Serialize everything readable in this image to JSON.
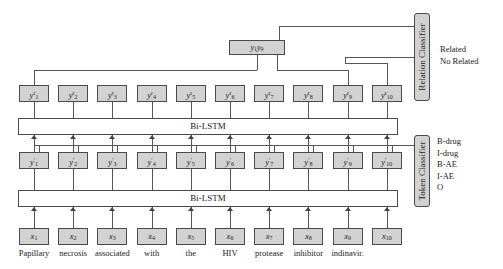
{
  "diagram": {
    "sentence_words": [
      "Papillary",
      "necrosis",
      "associated",
      "with",
      "the",
      "HIV",
      "protease",
      "inhibitor",
      "indinavir."
    ],
    "input_nodes": [
      {
        "base": "x",
        "sub": "1"
      },
      {
        "base": "x",
        "sub": "2"
      },
      {
        "base": "x",
        "sub": "3"
      },
      {
        "base": "x",
        "sub": "4"
      },
      {
        "base": "x",
        "sub": "5"
      },
      {
        "base": "x",
        "sub": "6"
      },
      {
        "base": "x",
        "sub": "7"
      },
      {
        "base": "x",
        "sub": "8"
      },
      {
        "base": "x",
        "sub": "9"
      },
      {
        "base": "x",
        "sub": "10"
      }
    ],
    "mid_nodes": [
      {
        "base": "y",
        "sub": "1",
        "sup": "′"
      },
      {
        "base": "y",
        "sub": "2",
        "sup": "′"
      },
      {
        "base": "y",
        "sub": "3",
        "sup": "′"
      },
      {
        "base": "y",
        "sub": "4",
        "sup": "′"
      },
      {
        "base": "y",
        "sub": "5",
        "sup": "′"
      },
      {
        "base": "y",
        "sub": "6",
        "sup": "′"
      },
      {
        "base": "y",
        "sub": "7",
        "sup": "′"
      },
      {
        "base": "y",
        "sub": "8",
        "sup": "′"
      },
      {
        "base": "y",
        "sub": "9",
        "sup": "′"
      },
      {
        "base": "y",
        "sub": "10",
        "sup": "′"
      }
    ],
    "top_nodes": [
      {
        "base": "y",
        "sub": "1",
        "sup": "r"
      },
      {
        "base": "y",
        "sub": "2",
        "sup": "r"
      },
      {
        "base": "y",
        "sub": "3",
        "sup": "r"
      },
      {
        "base": "y",
        "sub": "4",
        "sup": "r"
      },
      {
        "base": "y",
        "sub": "5",
        "sup": "r"
      },
      {
        "base": "y",
        "sub": "6",
        "sup": "r"
      },
      {
        "base": "y",
        "sub": "7",
        "sup": "r"
      },
      {
        "base": "y",
        "sub": "8",
        "sup": "r"
      },
      {
        "base": "y",
        "sub": "9",
        "sup": "r"
      },
      {
        "base": "y",
        "sub": "10",
        "sup": "r"
      }
    ],
    "combo_node": {
      "base1": "y",
      "sub1": "1",
      "base2": "y",
      "sub2": "9"
    },
    "lstm_lower_label": "Bi-LSTM",
    "lstm_upper_label": "Bi-LSTM",
    "token_classifier": {
      "label": "Token Classifier",
      "outputs": [
        "B-drug",
        "I-drug",
        "B-AE",
        "I-AE",
        "O"
      ]
    },
    "relation_classifier": {
      "label": "Relation Classifier",
      "outputs": [
        "Related",
        "No Related"
      ]
    },
    "colors": {
      "node_fill": "#d2d2d2",
      "node_border": "#4a4a4a",
      "wire": "#555555",
      "background": "#ffffff"
    }
  }
}
